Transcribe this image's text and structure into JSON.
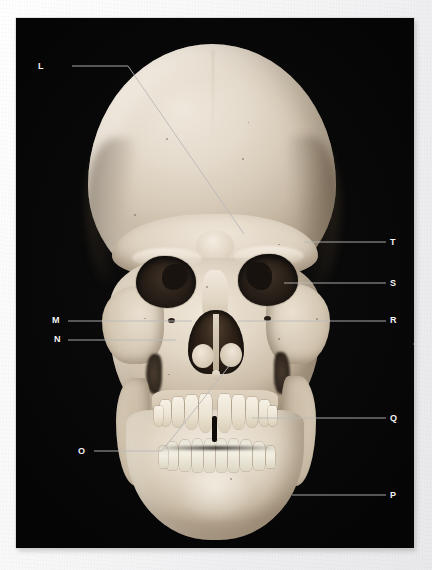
{
  "figure": {
    "kind": "anatomical-photograph",
    "background_color": "#050505",
    "page_color": "#f2f2f2",
    "label_color": "#f4f4f4",
    "leader_line_color": "#b9b9b9"
  },
  "labels": [
    {
      "id": "L",
      "text": "L",
      "x": 22,
      "y": 44,
      "side": "left"
    },
    {
      "id": "T",
      "text": "T",
      "x": 374,
      "y": 220,
      "side": "right"
    },
    {
      "id": "S",
      "text": "S",
      "x": 374,
      "y": 261,
      "side": "right"
    },
    {
      "id": "M",
      "text": "M",
      "x": 36,
      "y": 298,
      "side": "left"
    },
    {
      "id": "N",
      "text": "N",
      "x": 38,
      "y": 317,
      "side": "left"
    },
    {
      "id": "R",
      "text": "R",
      "x": 374,
      "y": 298,
      "side": "right"
    },
    {
      "id": "O",
      "text": "O",
      "x": 62,
      "y": 429,
      "side": "left"
    },
    {
      "id": "Q",
      "text": "Q",
      "x": 374,
      "y": 396,
      "side": "right"
    },
    {
      "id": "P",
      "text": "P",
      "x": 374,
      "y": 473,
      "side": "right"
    }
  ],
  "leaders": [
    {
      "id": "L",
      "points": "56,48 112,48 228,216"
    },
    {
      "id": "T",
      "points": "370,224 288,224"
    },
    {
      "id": "S",
      "points": "370,265 268,265"
    },
    {
      "id": "M",
      "points": "52,303 176,303"
    },
    {
      "id": "N",
      "points": "52,322 160,322"
    },
    {
      "id": "R",
      "points": "370,303 222,303"
    },
    {
      "id": "O",
      "points": "78,433 146,433 214,347"
    },
    {
      "id": "Q",
      "points": "370,400 236,400"
    },
    {
      "id": "P",
      "points": "370,477 276,477"
    }
  ]
}
